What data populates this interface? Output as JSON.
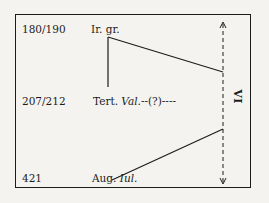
{
  "diagram": {
    "rows": [
      {
        "date": "180/190",
        "source": "Ir. gr.",
        "source_italic": ""
      },
      {
        "date": "207/212",
        "source": "Tert. ",
        "source_italic": "Val.",
        "suffix": "--(?)----"
      },
      {
        "date": "421",
        "source": "Aug. ",
        "source_italic": "Iul."
      }
    ],
    "axis_label": "VI",
    "colors": {
      "ink": "#1c1c1c",
      "paper": "#f4f3f0"
    }
  }
}
